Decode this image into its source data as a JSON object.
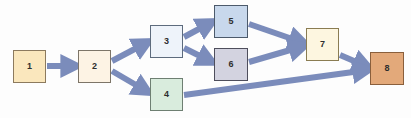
{
  "diagram": {
    "background_color": "#fdfdfd",
    "edge_color": "#7b8cbb",
    "edge_width": 6,
    "canvas": {
      "width": 411,
      "height": 118
    },
    "nodes": [
      {
        "id": "1",
        "label": "1",
        "x": 13,
        "y": 50,
        "w": 33,
        "h": 33,
        "fill": "#fae7bd",
        "stroke": "#8c7a5e"
      },
      {
        "id": "2",
        "label": "2",
        "x": 78,
        "y": 50,
        "w": 33,
        "h": 33,
        "fill": "#fdf3e4",
        "stroke": "#7d7568"
      },
      {
        "id": "3",
        "label": "3",
        "x": 150,
        "y": 25,
        "w": 33,
        "h": 33,
        "fill": "#eef3fa",
        "stroke": "#5d6b7d"
      },
      {
        "id": "4",
        "label": "4",
        "x": 150,
        "y": 78,
        "w": 33,
        "h": 33,
        "fill": "#d9ecdd",
        "stroke": "#6e7f72"
      },
      {
        "id": "5",
        "label": "5",
        "x": 214,
        "y": 5,
        "w": 34,
        "h": 33,
        "fill": "#c8d8ec",
        "stroke": "#4c5a6b"
      },
      {
        "id": "6",
        "label": "6",
        "x": 214,
        "y": 48,
        "w": 34,
        "h": 33,
        "fill": "#d3d3e0",
        "stroke": "#4e4e5c"
      },
      {
        "id": "7",
        "label": "7",
        "x": 306,
        "y": 28,
        "w": 33,
        "h": 33,
        "fill": "#fdf6e0",
        "stroke": "#8a7c52"
      },
      {
        "id": "8",
        "label": "8",
        "x": 370,
        "y": 52,
        "w": 34,
        "h": 33,
        "fill": "#e3a97a",
        "stroke": "#8a5f3c"
      }
    ],
    "edges": [
      {
        "from": "1",
        "to": "2",
        "x1": 47,
        "y1": 66,
        "x2": 76,
        "y2": 66
      },
      {
        "from": "2",
        "to": "3",
        "x1": 112,
        "y1": 61,
        "x2": 148,
        "y2": 42
      },
      {
        "from": "2",
        "to": "4",
        "x1": 112,
        "y1": 71,
        "x2": 148,
        "y2": 92
      },
      {
        "from": "3",
        "to": "5",
        "x1": 184,
        "y1": 37,
        "x2": 212,
        "y2": 22
      },
      {
        "from": "3",
        "to": "6",
        "x1": 184,
        "y1": 48,
        "x2": 212,
        "y2": 62
      },
      {
        "from": "5",
        "to": "7",
        "x1": 249,
        "y1": 24,
        "x2": 304,
        "y2": 43
      },
      {
        "from": "6",
        "to": "7",
        "x1": 249,
        "y1": 62,
        "x2": 304,
        "y2": 46
      },
      {
        "from": "7",
        "to": "8",
        "x1": 340,
        "y1": 55,
        "x2": 368,
        "y2": 67
      },
      {
        "from": "4",
        "to": "8",
        "x1": 184,
        "y1": 95,
        "x2": 368,
        "y2": 70
      }
    ]
  }
}
